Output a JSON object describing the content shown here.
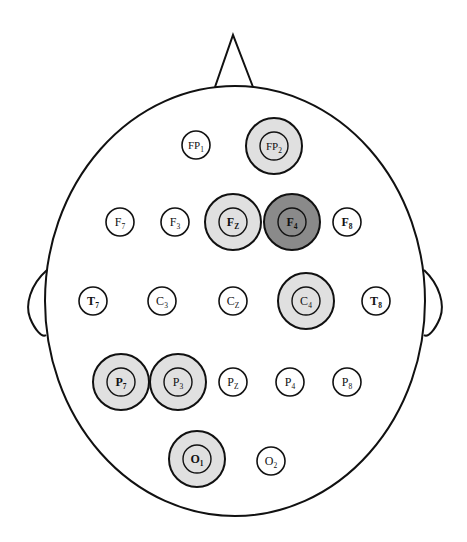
{
  "colors": {
    "outline": "#111111",
    "highlight_light": "#e0e0e0",
    "highlight_dark": "#8a8a8a",
    "background": "#ffffff"
  },
  "head": {
    "cx": 235,
    "cy": 301,
    "rx": 190,
    "ry": 215,
    "nose": {
      "left": [
        215,
        87
      ],
      "apex": [
        233,
        35
      ],
      "right": [
        253,
        87
      ]
    },
    "left_ear": "M 47 270 C 30 285, 25 305, 30 318 C 35 330, 42 338, 46 335",
    "right_ear": "M 424 270 C 440 285, 445 305, 440 318 C 435 330, 428 338, 424 335"
  },
  "electrodes": [
    {
      "id": "FP1",
      "main": "FP",
      "sub": "1",
      "x": 196,
      "y": 145,
      "state": "none",
      "bold": false
    },
    {
      "id": "FP2",
      "main": "FP",
      "sub": "2",
      "x": 274,
      "y": 146,
      "state": "light",
      "bold": false
    },
    {
      "id": "F7",
      "main": "F",
      "sub": "7",
      "x": 120,
      "y": 222,
      "state": "none",
      "bold": false
    },
    {
      "id": "F3",
      "main": "F",
      "sub": "3",
      "x": 175,
      "y": 222,
      "state": "none",
      "bold": false
    },
    {
      "id": "FZ",
      "main": "F",
      "sub": "Z",
      "x": 233,
      "y": 222,
      "state": "light",
      "bold": true
    },
    {
      "id": "F4",
      "main": "F",
      "sub": "4",
      "x": 292,
      "y": 222,
      "state": "dark",
      "bold": true
    },
    {
      "id": "F8",
      "main": "F",
      "sub": "8",
      "x": 347,
      "y": 222,
      "state": "none",
      "bold": true
    },
    {
      "id": "T7",
      "main": "T",
      "sub": "7",
      "x": 93,
      "y": 301,
      "state": "none",
      "bold": true
    },
    {
      "id": "C3",
      "main": "C",
      "sub": "3",
      "x": 162,
      "y": 301,
      "state": "none",
      "bold": false
    },
    {
      "id": "CZ",
      "main": "C",
      "sub": "Z",
      "x": 233,
      "y": 301,
      "state": "none",
      "bold": false
    },
    {
      "id": "C4",
      "main": "C",
      "sub": "4",
      "x": 306,
      "y": 301,
      "state": "light",
      "bold": false
    },
    {
      "id": "T8",
      "main": "T",
      "sub": "8",
      "x": 376,
      "y": 301,
      "state": "none",
      "bold": true
    },
    {
      "id": "P7",
      "main": "P",
      "sub": "7",
      "x": 121,
      "y": 382,
      "state": "light",
      "bold": true
    },
    {
      "id": "P3",
      "main": "P",
      "sub": "3",
      "x": 178,
      "y": 382,
      "state": "light",
      "bold": false
    },
    {
      "id": "PZ",
      "main": "P",
      "sub": "Z",
      "x": 233,
      "y": 382,
      "state": "none",
      "bold": false
    },
    {
      "id": "P4",
      "main": "P",
      "sub": "4",
      "x": 290,
      "y": 382,
      "state": "none",
      "bold": false
    },
    {
      "id": "P8",
      "main": "P",
      "sub": "8",
      "x": 347,
      "y": 382,
      "state": "none",
      "bold": false
    },
    {
      "id": "O1",
      "main": "O",
      "sub": "1",
      "x": 197,
      "y": 459,
      "state": "light",
      "bold": true
    },
    {
      "id": "O2",
      "main": "O",
      "sub": "2",
      "x": 271,
      "y": 461,
      "state": "none",
      "bold": false
    }
  ],
  "radii": {
    "inner": 14,
    "outer": 28
  }
}
